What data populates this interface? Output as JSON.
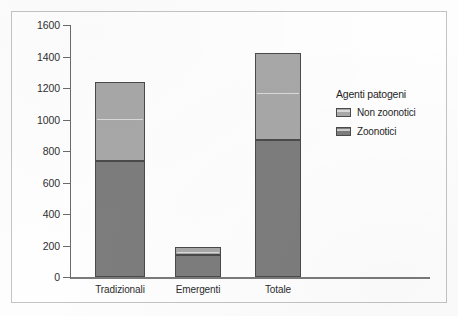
{
  "chart_data": {
    "type": "bar",
    "subtype": "stacked",
    "title": "",
    "xlabel": "",
    "ylabel": "",
    "categories": [
      "Tradizionali",
      "Emergenti",
      "Totale"
    ],
    "series": [
      {
        "name": "Zoonotici",
        "values": [
          735,
          140,
          870
        ],
        "color": "#7d7d7d"
      },
      {
        "name": "Non zoonotici",
        "values": [
          500,
          50,
          550
        ],
        "color": "#a8a8a8"
      }
    ],
    "totals": [
      1235,
      190,
      1420
    ],
    "ylim": [
      0,
      1600
    ],
    "yticks": [
      0,
      200,
      400,
      600,
      800,
      1000,
      1200,
      1400,
      1600
    ],
    "ytick_labels": [
      "0",
      "200",
      "400",
      "600",
      "800",
      "1000",
      "1200",
      "1400",
      "1600"
    ],
    "grid": false,
    "legend": {
      "title": "Agenti patogeni",
      "position": "right",
      "entries": [
        {
          "label": "Non zoonotici",
          "color": "#a8a8a8"
        },
        {
          "label": "Zoonotici",
          "color": "#7d7d7d"
        }
      ]
    }
  }
}
